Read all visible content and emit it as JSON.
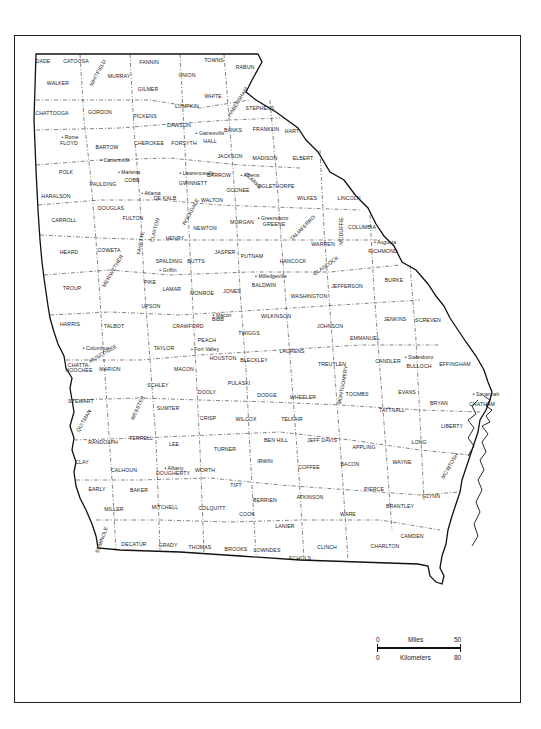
{
  "map": {
    "subject": "Georgia counties",
    "counties": [
      {
        "name": "DADE",
        "x": 43,
        "y": 62
      },
      {
        "name": "CATOOSA",
        "x": 76,
        "y": 62
      },
      {
        "name": "WHITFIELD",
        "x": 98,
        "y": 73,
        "rot": -62
      },
      {
        "name": "MURRAY",
        "x": 119,
        "y": 77
      },
      {
        "name": "FANNIN",
        "x": 149,
        "y": 63
      },
      {
        "name": "TOWNS",
        "x": 214,
        "y": 61
      },
      {
        "name": "RABUN",
        "x": 245,
        "y": 68
      },
      {
        "name": "UNION",
        "x": 187,
        "y": 76
      },
      {
        "name": "WALKER",
        "x": 58,
        "y": 84
      },
      {
        "name": "GILMER",
        "x": 148,
        "y": 90
      },
      {
        "name": "WHITE",
        "x": 213,
        "y": 97
      },
      {
        "name": "HABERSHAM",
        "x": 238,
        "y": 102,
        "rot": -58
      },
      {
        "name": "LUMPKIN",
        "x": 187,
        "y": 107
      },
      {
        "name": "STEPHENS",
        "x": 260,
        "y": 109
      },
      {
        "name": "CHATTOOGA",
        "x": 52,
        "y": 114
      },
      {
        "name": "GORDON",
        "x": 100,
        "y": 113
      },
      {
        "name": "PICKENS",
        "x": 145,
        "y": 117
      },
      {
        "name": "DAWSON",
        "x": 179,
        "y": 126
      },
      {
        "name": "BANKS",
        "x": 233,
        "y": 131
      },
      {
        "name": "FRANKLIN",
        "x": 266,
        "y": 130
      },
      {
        "name": "HART",
        "x": 292,
        "y": 132
      },
      {
        "name": "HALL",
        "x": 210,
        "y": 142
      },
      {
        "name": "FLOYD",
        "x": 69,
        "y": 144
      },
      {
        "name": "BARTOW",
        "x": 107,
        "y": 148
      },
      {
        "name": "CHEROKEE",
        "x": 149,
        "y": 144
      },
      {
        "name": "FORSYTH",
        "x": 184,
        "y": 144
      },
      {
        "name": "JACKSON",
        "x": 230,
        "y": 157
      },
      {
        "name": "MADISON",
        "x": 265,
        "y": 159
      },
      {
        "name": "ELBERT",
        "x": 303,
        "y": 159
      },
      {
        "name": "POLK",
        "x": 66,
        "y": 173
      },
      {
        "name": "COBB",
        "x": 132,
        "y": 181
      },
      {
        "name": "BARROW",
        "x": 219,
        "y": 176
      },
      {
        "name": "CLARKE",
        "x": 253,
        "y": 181,
        "rot": 45
      },
      {
        "name": "PAULDING",
        "x": 103,
        "y": 185
      },
      {
        "name": "GWINNETT",
        "x": 193,
        "y": 184
      },
      {
        "name": "OGLETHORPE",
        "x": 276,
        "y": 187
      },
      {
        "name": "OCONEE",
        "x": 238,
        "y": 191
      },
      {
        "name": "HARALSON",
        "x": 56,
        "y": 197
      },
      {
        "name": "DE KALB",
        "x": 165,
        "y": 199
      },
      {
        "name": "WALTON",
        "x": 212,
        "y": 201
      },
      {
        "name": "WILKES",
        "x": 307,
        "y": 199
      },
      {
        "name": "LINCOLN",
        "x": 349,
        "y": 199
      },
      {
        "name": "ROCKDALE",
        "x": 191,
        "y": 212,
        "rot": -62
      },
      {
        "name": "DOUGLAS",
        "x": 111,
        "y": 209
      },
      {
        "name": "FULTON",
        "x": 133,
        "y": 219
      },
      {
        "name": "CARROLL",
        "x": 64,
        "y": 221
      },
      {
        "name": "NEWTON",
        "x": 205,
        "y": 229
      },
      {
        "name": "MORGAN",
        "x": 242,
        "y": 223
      },
      {
        "name": "GREENE",
        "x": 274,
        "y": 225
      },
      {
        "name": "COLUMBIA",
        "x": 362,
        "y": 228
      },
      {
        "name": "CLAYTON",
        "x": 155,
        "y": 230,
        "rot": -75
      },
      {
        "name": "HENRY",
        "x": 175,
        "y": 239
      },
      {
        "name": "FAYETTE",
        "x": 141,
        "y": 243,
        "rot": -80
      },
      {
        "name": "TALIAFERRO",
        "x": 303,
        "y": 228,
        "rot": -45
      },
      {
        "name": "MCDUFFIE",
        "x": 342,
        "y": 231,
        "rot": -90
      },
      {
        "name": "COWETA",
        "x": 109,
        "y": 251
      },
      {
        "name": "HEARD",
        "x": 69,
        "y": 253
      },
      {
        "name": "JASPER",
        "x": 225,
        "y": 253
      },
      {
        "name": "WARREN",
        "x": 323,
        "y": 245
      },
      {
        "name": "RICHMOND",
        "x": 383,
        "y": 252
      },
      {
        "name": "SPALDING",
        "x": 169,
        "y": 262
      },
      {
        "name": "BUTTS",
        "x": 196,
        "y": 262
      },
      {
        "name": "PUTNAM",
        "x": 252,
        "y": 257
      },
      {
        "name": "HANCOCK",
        "x": 293,
        "y": 262
      },
      {
        "name": "GLASCOCK",
        "x": 326,
        "y": 266,
        "rot": -35
      },
      {
        "name": "BURKE",
        "x": 394,
        "y": 281
      },
      {
        "name": "JEFFERSON",
        "x": 347,
        "y": 287
      },
      {
        "name": "MERIWETHER",
        "x": 113,
        "y": 271,
        "rot": -60
      },
      {
        "name": "TROUP",
        "x": 72,
        "y": 289
      },
      {
        "name": "PIKE",
        "x": 150,
        "y": 283
      },
      {
        "name": "LAMAR",
        "x": 172,
        "y": 290
      },
      {
        "name": "MONROE",
        "x": 202,
        "y": 294
      },
      {
        "name": "JONES",
        "x": 232,
        "y": 292
      },
      {
        "name": "BALDWIN",
        "x": 264,
        "y": 286
      },
      {
        "name": "WASHINGTON",
        "x": 309,
        "y": 297
      },
      {
        "name": "UPSON",
        "x": 151,
        "y": 307
      },
      {
        "name": "WILKINSON",
        "x": 276,
        "y": 317
      },
      {
        "name": "JENKINS",
        "x": 395,
        "y": 320
      },
      {
        "name": "SCREVEN",
        "x": 428,
        "y": 321
      },
      {
        "name": "HARRIS",
        "x": 70,
        "y": 325
      },
      {
        "name": "TALBOT",
        "x": 114,
        "y": 327
      },
      {
        "name": "CRAWFORD",
        "x": 188,
        "y": 327
      },
      {
        "name": "BIBB",
        "x": 218,
        "y": 320
      },
      {
        "name": "JOHNSON",
        "x": 330,
        "y": 327
      },
      {
        "name": "TWIGGS",
        "x": 249,
        "y": 334
      },
      {
        "name": "EMMANUEL",
        "x": 365,
        "y": 339
      },
      {
        "name": "PEACH",
        "x": 207,
        "y": 341
      },
      {
        "name": "TAYLOR",
        "x": 164,
        "y": 349
      },
      {
        "name": "MUSCOGEE",
        "x": 103,
        "y": 354,
        "rot": -30
      },
      {
        "name": "HOUSTON",
        "x": 223,
        "y": 359
      },
      {
        "name": "LAURENS",
        "x": 292,
        "y": 352
      },
      {
        "name": "BLECKLEY",
        "x": 254,
        "y": 361
      },
      {
        "name": "CANDLER",
        "x": 388,
        "y": 362
      },
      {
        "name": "BULLOCH",
        "x": 419,
        "y": 367
      },
      {
        "name": "EFFINGHAM",
        "x": 455,
        "y": 365
      },
      {
        "name": "CHATTAHOOCHEE",
        "x": 79,
        "y": 368,
        "two_line": true
      },
      {
        "name": "MARION",
        "x": 110,
        "y": 370
      },
      {
        "name": "MACON",
        "x": 184,
        "y": 370
      },
      {
        "name": "TREUTLEN",
        "x": 332,
        "y": 365
      },
      {
        "name": "SCHLEY",
        "x": 158,
        "y": 386
      },
      {
        "name": "DOOLY",
        "x": 207,
        "y": 393
      },
      {
        "name": "PULASKI",
        "x": 239,
        "y": 384
      },
      {
        "name": "DODGE",
        "x": 267,
        "y": 396
      },
      {
        "name": "WHEELER",
        "x": 303,
        "y": 398
      },
      {
        "name": "MONTGOMERY",
        "x": 343,
        "y": 385,
        "rot": -80
      },
      {
        "name": "TOOMBS",
        "x": 357,
        "y": 395
      },
      {
        "name": "EVANS",
        "x": 407,
        "y": 393
      },
      {
        "name": "TATTNALL",
        "x": 392,
        "y": 411
      },
      {
        "name": "BRYAN",
        "x": 439,
        "y": 404
      },
      {
        "name": "CHATHAM",
        "x": 482,
        "y": 405
      },
      {
        "name": "STEWART",
        "x": 81,
        "y": 402
      },
      {
        "name": "WEBSTER",
        "x": 138,
        "y": 408,
        "rot": -65
      },
      {
        "name": "SUMTER",
        "x": 168,
        "y": 409
      },
      {
        "name": "CRISP",
        "x": 208,
        "y": 419
      },
      {
        "name": "WILCOX",
        "x": 246,
        "y": 420
      },
      {
        "name": "TELFAIR",
        "x": 292,
        "y": 420
      },
      {
        "name": "LIBERTY",
        "x": 452,
        "y": 427
      },
      {
        "name": "QUITMAN",
        "x": 84,
        "y": 421,
        "rot": -60
      },
      {
        "name": "RANDOLPH",
        "x": 103,
        "y": 443
      },
      {
        "name": "TERRELL",
        "x": 141,
        "y": 439
      },
      {
        "name": "LEE",
        "x": 174,
        "y": 445
      },
      {
        "name": "BEN HILL",
        "x": 276,
        "y": 441
      },
      {
        "name": "JEFF DAVIS",
        "x": 322,
        "y": 441
      },
      {
        "name": "TURNER",
        "x": 225,
        "y": 450
      },
      {
        "name": "APPLING",
        "x": 364,
        "y": 448
      },
      {
        "name": "LONG",
        "x": 419,
        "y": 443
      },
      {
        "name": "CLAY",
        "x": 82,
        "y": 463
      },
      {
        "name": "CALHOUN",
        "x": 124,
        "y": 471
      },
      {
        "name": "DOUGHERTY",
        "x": 173,
        "y": 474
      },
      {
        "name": "WORTH",
        "x": 205,
        "y": 471
      },
      {
        "name": "IRWIN",
        "x": 265,
        "y": 462
      },
      {
        "name": "COFFEE",
        "x": 309,
        "y": 468
      },
      {
        "name": "BACON",
        "x": 350,
        "y": 465
      },
      {
        "name": "WAYNE",
        "x": 402,
        "y": 463
      },
      {
        "name": "MCINTOSH",
        "x": 450,
        "y": 466,
        "rot": -60
      },
      {
        "name": "EARLY",
        "x": 97,
        "y": 490
      },
      {
        "name": "BAKER",
        "x": 139,
        "y": 491
      },
      {
        "name": "TIFT",
        "x": 236,
        "y": 486
      },
      {
        "name": "PIERCE",
        "x": 374,
        "y": 490
      },
      {
        "name": "MILLER",
        "x": 114,
        "y": 510
      },
      {
        "name": "MITCHELL",
        "x": 165,
        "y": 508
      },
      {
        "name": "COLQUITT",
        "x": 212,
        "y": 509
      },
      {
        "name": "BERRIEN",
        "x": 265,
        "y": 501
      },
      {
        "name": "ATKINSON",
        "x": 310,
        "y": 498
      },
      {
        "name": "GLYNN",
        "x": 431,
        "y": 497
      },
      {
        "name": "BRANTLEY",
        "x": 400,
        "y": 507
      },
      {
        "name": "COOK",
        "x": 247,
        "y": 515
      },
      {
        "name": "WARE",
        "x": 348,
        "y": 515
      },
      {
        "name": "LANIER",
        "x": 285,
        "y": 527
      },
      {
        "name": "SEMINOLE",
        "x": 102,
        "y": 540,
        "rot": -70
      },
      {
        "name": "DECATUR",
        "x": 134,
        "y": 545
      },
      {
        "name": "GRADY",
        "x": 168,
        "y": 546
      },
      {
        "name": "THOMAS",
        "x": 200,
        "y": 548
      },
      {
        "name": "BROOKS",
        "x": 236,
        "y": 550
      },
      {
        "name": "LOWNDES",
        "x": 267,
        "y": 551
      },
      {
        "name": "CLINCH",
        "x": 327,
        "y": 548
      },
      {
        "name": "CHARLTON",
        "x": 385,
        "y": 547
      },
      {
        "name": "CAMDEN",
        "x": 412,
        "y": 537
      },
      {
        "name": "ECHOLS",
        "x": 300,
        "y": 559
      }
    ],
    "cities": [
      {
        "name": "Rome",
        "x": 70,
        "y": 137
      },
      {
        "name": "Cartersville",
        "x": 115,
        "y": 160
      },
      {
        "name": "Gainesville",
        "x": 210,
        "y": 133
      },
      {
        "name": "Marietta",
        "x": 129,
        "y": 172
      },
      {
        "name": "Lawrenceville",
        "x": 197,
        "y": 173
      },
      {
        "name": "Athens",
        "x": 250,
        "y": 175
      },
      {
        "name": "Atlanta",
        "x": 151,
        "y": 193
      },
      {
        "name": "Greensboro",
        "x": 273,
        "y": 218
      },
      {
        "name": "Augusta",
        "x": 385,
        "y": 242
      },
      {
        "name": "Griffin",
        "x": 168,
        "y": 270
      },
      {
        "name": "Milledgeville",
        "x": 271,
        "y": 276
      },
      {
        "name": "Macon",
        "x": 222,
        "y": 315
      },
      {
        "name": "Fort Valley",
        "x": 205,
        "y": 349
      },
      {
        "name": "Columbus",
        "x": 96,
        "y": 348
      },
      {
        "name": "Statesboro",
        "x": 419,
        "y": 357
      },
      {
        "name": "Savannah",
        "x": 486,
        "y": 394
      },
      {
        "name": "Albany",
        "x": 174,
        "y": 468
      }
    ]
  },
  "scale_bar": {
    "miles_label": "Miles",
    "miles_start": "0",
    "miles_end": "50",
    "km_label": "Kilometers",
    "km_start": "0",
    "km_end": "80"
  }
}
